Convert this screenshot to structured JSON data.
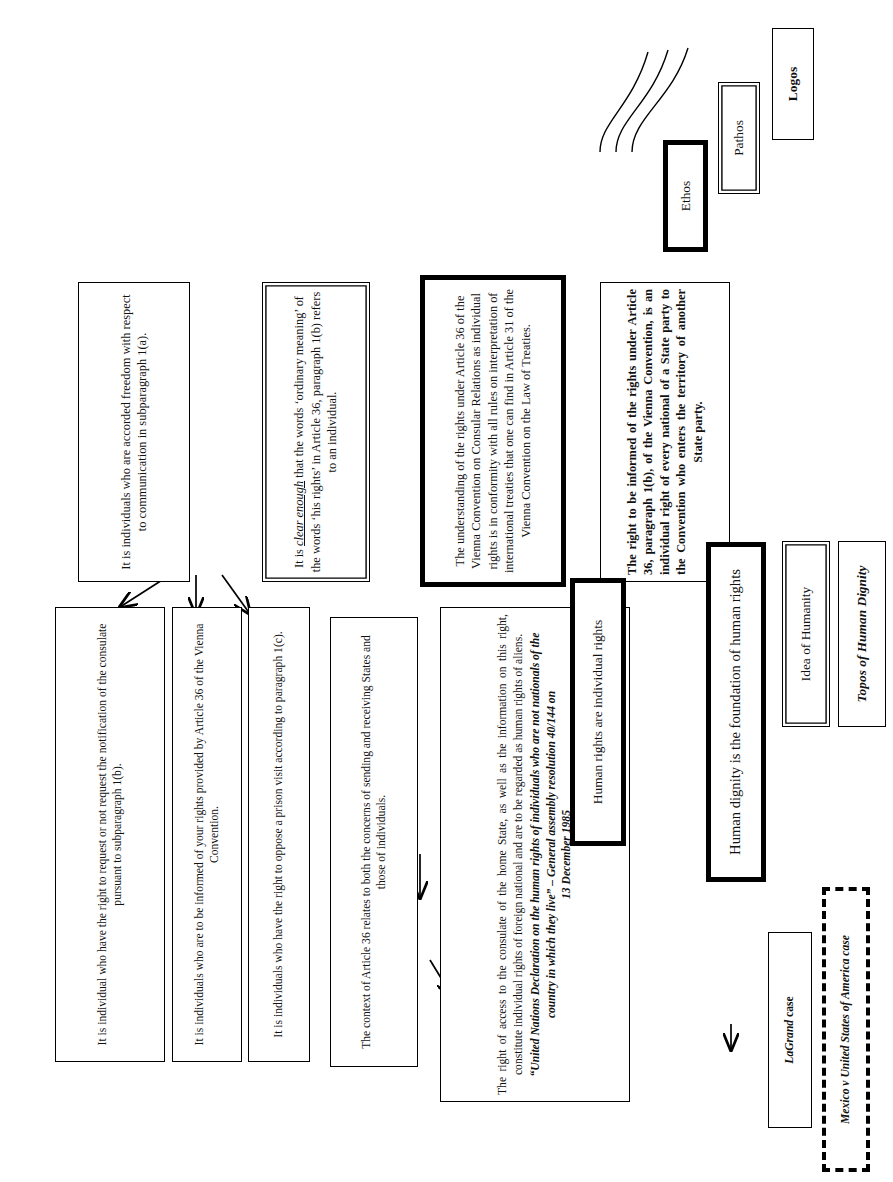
{
  "diagram": {
    "orientation": "rotated-90-ccw",
    "colors": {
      "ink": "#000000",
      "paper": "#ffffff"
    }
  },
  "legend_cases": [
    {
      "id": "lagrand",
      "style": "solid",
      "text_html": "LaGrand case",
      "italic_part": "LaGrand",
      "plain_part": " case"
    },
    {
      "id": "avena",
      "style": "dashed",
      "text": "Mexico v United States of America case"
    }
  ],
  "legend_modes": [
    {
      "id": "ethos",
      "label": "Ethos",
      "style": "thick-border"
    },
    {
      "id": "pathos",
      "label": "Pathos",
      "style": "double-border"
    },
    {
      "id": "logos",
      "label": "Logos",
      "style": "bold-text"
    }
  ],
  "nodes": {
    "claim_1a": "It is individuals who are accorded freedom with respect to communication in subparagraph 1(a).",
    "claim_1b": "It is individual who have the right to request or not request the notification of the consulate pursuant to subparagraph 1(b).",
    "claim_informed": "It is individuals who are to be informed of your rights provided by Article 36 of the Vienna Convention.",
    "claim_1c": "It is individuals who have the right to oppose a prison visit according to paragraph 1(c).",
    "context_article36": "The context of Article 36 relates to both the concerns of sending and receiving States and those of individuals.",
    "ordinary_meaning": {
      "pre": "It is ",
      "emph": "clear enough",
      "post": " that the words ‘ordinary meaning’ of the words ‘his rights’ in Article 36, paragraph 1(b) refers to an individual."
    },
    "understanding_rights": "The understanding of the rights under Article 36 of the Vienna Convention on Consular Relations as individual rights is in conformity with all rules on interpretation of international treaties that one can find in Article 31 of the Vienna Convention on the Law of Treaties.",
    "right_to_be_informed": "The right to be informed of the rights under Article 36, paragraph 1(b), of the Vienna Convention, is an individual right of every national of a State party to the Convention who enters the territory of another State party.",
    "right_of_access": {
      "para": "The right of access to the consulate of the home State, as well as the information on this right, constitute individual rights of foreign national and are to be regarded as human rights of aliens.",
      "quote": "“United Nations Declaration on the human rights of individuals who are not nationals of the country in which they live” – General assembly resolution 40/144 on",
      "date": "13 December 1985"
    },
    "human_rights_individual": "Human rights are individual rights",
    "human_dignity_foundation": "Human dignity is the foundation of human rights",
    "idea_of_humanity": "Idea of Humanity",
    "topos_human_dignity": "Topos of Human Dignity"
  }
}
